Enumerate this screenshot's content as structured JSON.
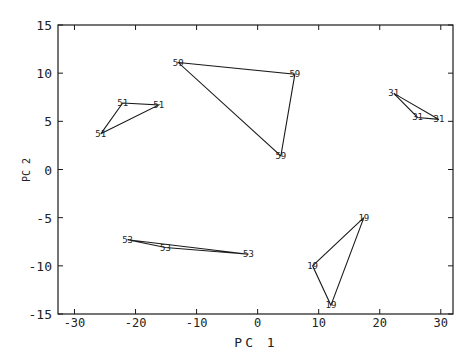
{
  "chart_data": {
    "type": "scatter",
    "title": "",
    "xlabel": "PC 1",
    "ylabel": "PC 2",
    "xlim": [
      -32.7,
      32.0
    ],
    "ylim": [
      -15,
      15
    ],
    "xticks": [
      -30,
      -20,
      -10,
      0,
      10,
      20,
      30
    ],
    "yticks": [
      -15,
      -10,
      -5,
      0,
      5,
      10,
      15
    ],
    "grid": false,
    "legend": null,
    "marker_style": "text labels at triangle vertices",
    "series": [
      {
        "name": "51",
        "points": [
          [
            -22.1,
            6.9
          ],
          [
            -16.2,
            6.7
          ],
          [
            -25.7,
            3.7
          ]
        ]
      },
      {
        "name": "59",
        "points": [
          [
            -13.0,
            11.1
          ],
          [
            6.1,
            9.9
          ],
          [
            3.8,
            1.4
          ]
        ]
      },
      {
        "name": "31",
        "points": [
          [
            22.3,
            7.9
          ],
          [
            26.2,
            5.4
          ],
          [
            29.7,
            5.2
          ]
        ]
      },
      {
        "name": "53",
        "points": [
          [
            -21.3,
            -7.3
          ],
          [
            -15.1,
            -8.1
          ],
          [
            -1.5,
            -8.8
          ]
        ]
      },
      {
        "name": "19",
        "points": [
          [
            17.4,
            -5.0
          ],
          [
            9.0,
            -10.0
          ],
          [
            12.0,
            -14.1
          ]
        ]
      }
    ]
  },
  "colors": {
    "line": "#1a1a1a",
    "text": "#222222",
    "background": "#ffffff"
  }
}
